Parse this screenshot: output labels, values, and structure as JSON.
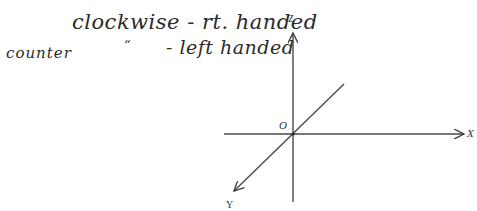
{
  "notes": {
    "line1": "clockwise - rt. handed",
    "line2_counter": "counter",
    "line2_ditto": "“",
    "line2_rest": "- left handed"
  },
  "axes": {
    "x_label": "X",
    "y_label": "Y",
    "z_label": "Z",
    "origin_label": "O",
    "line_color": "#4a4a4a"
  }
}
